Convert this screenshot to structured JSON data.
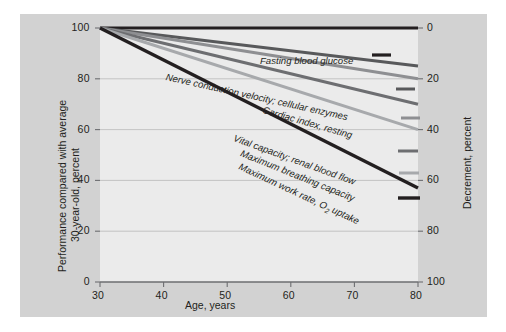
{
  "figure": {
    "background_color": "#d2d2d2",
    "plot_background_color": "#ebebeb"
  },
  "axes": {
    "x": {
      "title": "Age, years",
      "ticks": [
        "30",
        "40",
        "50",
        "60",
        "70",
        "80"
      ],
      "min": 30,
      "max": 80
    },
    "y_left": {
      "title_line1": "Performance compared with average",
      "title_line2": "30-year-old, percent",
      "ticks": [
        "0",
        "20",
        "40",
        "60",
        "80",
        "100"
      ],
      "min": 0,
      "max": 100
    },
    "y_right": {
      "title": "Decrement, percent",
      "ticks": [
        "0",
        "20",
        "40",
        "60",
        "80",
        "100"
      ],
      "min": 0,
      "max": 100
    }
  },
  "chart_data": {
    "type": "line",
    "title": "",
    "xlabel": "Age, years",
    "ylabel": "Performance compared with average 30-year-old, percent",
    "y2label": "Decrement, percent",
    "xlim": [
      30,
      80
    ],
    "ylim": [
      0,
      100
    ],
    "y2lim": [
      100,
      0
    ],
    "grid": true,
    "legend": "inline-end-labels",
    "x": [
      30,
      80
    ],
    "series": [
      {
        "name": "Fasting blood glucose",
        "label": "Fasting blood glucose",
        "values": [
          100,
          100
        ],
        "decrement_at_80": 0,
        "color": "#231f20",
        "width": 3.2,
        "label_x": 240,
        "label_y": 41,
        "label_angle": 0,
        "dash_x1": 352,
        "dash_x2": 371,
        "dash_y": 41
      },
      {
        "name": "Nerve conduction velocity; cellular enzymes",
        "label": "Nerve conduction velocity; cellular enzymes",
        "values": [
          100,
          85
        ],
        "decrement_at_80": 15,
        "color": "#58595b",
        "width": 3.0,
        "label_x": 146,
        "label_y": 57,
        "label_angle": 12.5,
        "dash_x1": 376,
        "dash_x2": 395,
        "dash_y": 75
      },
      {
        "name": "Cardiac index, resting",
        "label": "Cardiac index, resting",
        "values": [
          100,
          80
        ],
        "decrement_at_80": 20,
        "color": "#8e8f92",
        "width": 3.0,
        "label_x": 243,
        "label_y": 90,
        "label_angle": 16,
        "dash_x1": 381,
        "dash_x2": 400,
        "dash_y": 104
      },
      {
        "name": "Vital capacity; renal blood flow",
        "label": "Vital capacity; renal blood flow",
        "values": [
          100,
          70
        ],
        "decrement_at_80": 30,
        "color": "#6d6e71",
        "width": 3.0,
        "label_x": 214,
        "label_y": 118,
        "label_angle": 20,
        "dash_x1": 378,
        "dash_x2": 398,
        "dash_y": 137
      },
      {
        "name": "Maximum breathing capacity",
        "label": "Maximum breathing capacity",
        "values": [
          100,
          60
        ],
        "decrement_at_80": 40,
        "color": "#a7a9ac",
        "width": 3.0,
        "label_x": 221,
        "label_y": 133,
        "label_angle": 22,
        "dash_x1": 379,
        "dash_x2": 399,
        "dash_y": 159
      },
      {
        "name": "Maximum work rate, O2 uptake",
        "label": "Maximum work rate, O",
        "label_sub": "2",
        "label_tail": " uptake",
        "values": [
          100,
          37
        ],
        "decrement_at_80": 63,
        "color": "#231f20",
        "width": 3.4,
        "label_x": 219,
        "label_y": 146,
        "label_angle": 25,
        "dash_x1": 378,
        "dash_x2": 400,
        "dash_y": 184
      }
    ]
  }
}
